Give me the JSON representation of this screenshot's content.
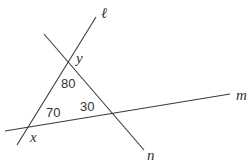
{
  "diagram": {
    "type": "geometry",
    "lines": [
      {
        "id": "l",
        "label": "ℓ"
      },
      {
        "id": "m",
        "label": "m"
      },
      {
        "id": "n",
        "label": "n"
      }
    ],
    "angles": {
      "top": "80",
      "left": "70",
      "right": "30"
    },
    "variables": {
      "y": "y",
      "x": "x"
    },
    "colors": {
      "line": "#3a3a3a",
      "text": "#333333",
      "background": "#ffffff"
    }
  }
}
